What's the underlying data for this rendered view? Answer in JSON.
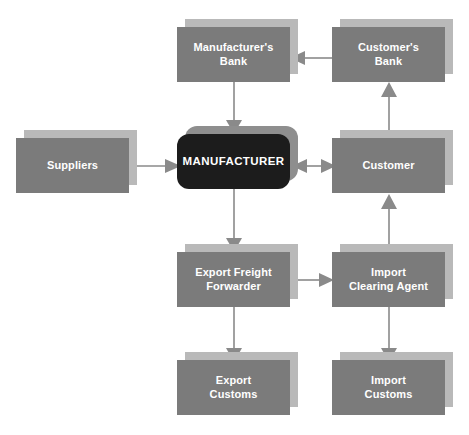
{
  "diagram": {
    "colors": {
      "box_fill": "#7b7b7b",
      "box_shadow": "#b9b9b9",
      "primary_fill": "#1c1c1c",
      "primary_shadow": "#8e8e8e",
      "label_text": "#ffffff",
      "connector": "#8a8a8a",
      "background": "#ffffff"
    },
    "nodes": [
      {
        "id": "manufacturers-bank",
        "label": "Manufacturer's\nBank",
        "x": 177,
        "y": 27,
        "w": 113,
        "h": 55,
        "style": "box"
      },
      {
        "id": "customers-bank",
        "label": "Customer's\nBank",
        "x": 332,
        "y": 27,
        "w": 113,
        "h": 55,
        "style": "box"
      },
      {
        "id": "suppliers",
        "label": "Suppliers",
        "x": 16,
        "y": 138,
        "w": 113,
        "h": 55,
        "style": "box"
      },
      {
        "id": "manufacturer",
        "label": "MANUFACTURER",
        "x": 177,
        "y": 134,
        "w": 113,
        "h": 55,
        "style": "primary"
      },
      {
        "id": "customer",
        "label": "Customer",
        "x": 332,
        "y": 138,
        "w": 113,
        "h": 55,
        "style": "box"
      },
      {
        "id": "export-freight-forwarder",
        "label": "Export Freight\nForwarder",
        "x": 177,
        "y": 252,
        "w": 113,
        "h": 55,
        "style": "box"
      },
      {
        "id": "import-clearing-agent",
        "label": "Import\nClearing Agent",
        "x": 332,
        "y": 252,
        "w": 113,
        "h": 55,
        "style": "box"
      },
      {
        "id": "export-customs",
        "label": "Export\nCustoms",
        "x": 177,
        "y": 360,
        "w": 113,
        "h": 55,
        "style": "box"
      },
      {
        "id": "import-customs",
        "label": "Import\nCustoms",
        "x": 332,
        "y": 360,
        "w": 113,
        "h": 55,
        "style": "box"
      }
    ],
    "connectors": [
      {
        "id": "customers-bank-to-manufacturers-bank",
        "from": "customers-bank",
        "to": "manufacturers-bank",
        "direction": "left",
        "orientation": "horizontal"
      },
      {
        "id": "manufacturers-bank-to-manufacturer",
        "from": "manufacturers-bank",
        "to": "manufacturer",
        "direction": "down",
        "orientation": "vertical"
      },
      {
        "id": "customer-to-customers-bank",
        "from": "customer",
        "to": "customers-bank",
        "direction": "up",
        "orientation": "vertical"
      },
      {
        "id": "suppliers-to-manufacturer",
        "from": "suppliers",
        "to": "manufacturer",
        "direction": "right",
        "orientation": "horizontal"
      },
      {
        "id": "manufacturer-to-customer",
        "from": "manufacturer",
        "to": "customer",
        "direction": "both",
        "orientation": "horizontal"
      },
      {
        "id": "manufacturer-to-export-freight-forwarder",
        "from": "manufacturer",
        "to": "export-freight-forwarder",
        "direction": "down",
        "orientation": "vertical"
      },
      {
        "id": "export-freight-forwarder-to-import-clearing-agent",
        "from": "export-freight-forwarder",
        "to": "import-clearing-agent",
        "direction": "right",
        "orientation": "horizontal"
      },
      {
        "id": "import-clearing-agent-to-customer",
        "from": "import-clearing-agent",
        "to": "customer",
        "direction": "up",
        "orientation": "vertical"
      },
      {
        "id": "export-freight-forwarder-to-export-customs",
        "from": "export-freight-forwarder",
        "to": "export-customs",
        "direction": "down",
        "orientation": "vertical"
      },
      {
        "id": "import-clearing-agent-to-import-customs",
        "from": "import-clearing-agent",
        "to": "import-customs",
        "direction": "down",
        "orientation": "vertical"
      }
    ]
  }
}
